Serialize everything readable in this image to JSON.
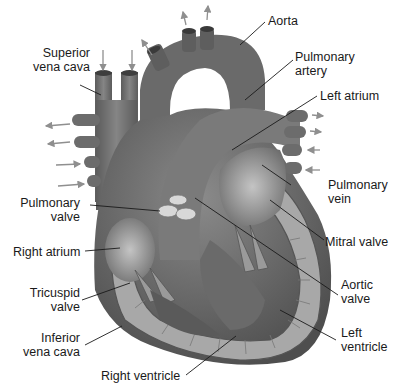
{
  "diagram": {
    "colors": {
      "tissue_dark": "#5a5a5a",
      "tissue_mid": "#7d7d7d",
      "tissue_light": "#a9a9a9",
      "valve": "#d8d8d8",
      "arrow": "#8f8f8f",
      "leader_line": "#1a1a1a",
      "background": "#ffffff"
    },
    "labels": {
      "superior_vena_cava": {
        "line1": "Superior",
        "line2": "vena cava"
      },
      "aorta": {
        "line1": "Aorta"
      },
      "pulmonary_artery": {
        "line1": "Pulmonary",
        "line2": "artery"
      },
      "left_atrium": {
        "line1": "Left atrium"
      },
      "pulmonary_vein": {
        "line1": "Pulmonary",
        "line2": "vein"
      },
      "pulmonary_valve": {
        "line1": "Pulmonary",
        "line2": "valve"
      },
      "mitral_valve": {
        "line1": "Mitral valve"
      },
      "right_atrium": {
        "line1": "Right atrium"
      },
      "aortic_valve": {
        "line1": "Aortic",
        "line2": "valve"
      },
      "tricuspid_valve": {
        "line1": "Tricuspid",
        "line2": "valve"
      },
      "left_ventricle": {
        "line1": "Left",
        "line2": "ventricle"
      },
      "inferior_vena_cava": {
        "line1": "Inferior",
        "line2": "vena cava"
      },
      "right_ventricle": {
        "line1": "Right ventricle"
      }
    }
  }
}
